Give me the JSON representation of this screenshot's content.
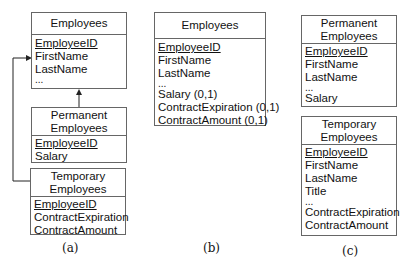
{
  "diagrams": {
    "a": {
      "caption": "(a)",
      "employees": {
        "title": "Employees",
        "attrs": [
          {
            "name": "EmployeeID",
            "key": true
          },
          {
            "name": "FirstName"
          },
          {
            "name": "LastName"
          },
          {
            "name": "..."
          }
        ]
      },
      "permanent": {
        "title_line1": "Permanent",
        "title_line2": "Employees",
        "attrs": [
          {
            "name": "EmployeeID",
            "key": true
          },
          {
            "name": "Salary"
          }
        ]
      },
      "temporary": {
        "title_line1": "Temporary",
        "title_line2": "Employees",
        "attrs": [
          {
            "name": "EmployeeID",
            "key": true
          },
          {
            "name": "ContractExpiration"
          },
          {
            "name": "ContractAmount"
          }
        ]
      },
      "edges": [
        {
          "from": "Permanent Employees",
          "to": "Employees",
          "type": "generalization-arrow"
        },
        {
          "from": "Temporary Employees",
          "to": "Employees",
          "type": "generalization-arrow"
        }
      ]
    },
    "b": {
      "caption": "(b)",
      "employees": {
        "title": "Employees",
        "attrs": [
          {
            "name": "EmployeeID",
            "key": true
          },
          {
            "name": "FirstName"
          },
          {
            "name": "LastName"
          },
          {
            "name": "..."
          },
          {
            "name": "Salary (0,1)"
          },
          {
            "name": "ContractExpiration (0,1)"
          },
          {
            "name": "ContractAmount (0,1)"
          }
        ]
      }
    },
    "c": {
      "caption": "(c)",
      "permanent": {
        "title_line1": "Permanent",
        "title_line2": "Employees",
        "attrs": [
          {
            "name": "EmployeeID",
            "key": true
          },
          {
            "name": "FirstName"
          },
          {
            "name": "LastName"
          },
          {
            "name": "..."
          },
          {
            "name": "Salary"
          }
        ]
      },
      "temporary": {
        "title_line1": "Temporary",
        "title_line2": "Employees",
        "attrs": [
          {
            "name": "EmployeeID",
            "key": true
          },
          {
            "name": "FirstName"
          },
          {
            "name": "LastName"
          },
          {
            "name": "Title"
          },
          {
            "name": "..."
          },
          {
            "name": "ContractExpiration"
          },
          {
            "name": "ContractAmount"
          }
        ]
      }
    }
  }
}
